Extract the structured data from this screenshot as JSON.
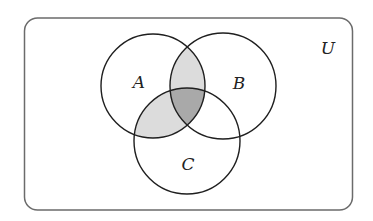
{
  "diagram": {
    "type": "venn",
    "universe": {
      "label": "U",
      "label_pos": [
        328,
        54
      ],
      "rect": {
        "x": 24.5,
        "y": 18,
        "w": 328,
        "h": 192,
        "rx": 13
      },
      "stroke": "#6b6b6b"
    },
    "sets": [
      {
        "name": "A",
        "label": "A",
        "cx": 153,
        "cy": 86,
        "r": 52,
        "label_pos": [
          139,
          88
        ]
      },
      {
        "name": "B",
        "label": "B",
        "cx": 223,
        "cy": 86,
        "r": 53,
        "label_pos": [
          239,
          89
        ]
      },
      {
        "name": "C",
        "label": "C",
        "cx": 187,
        "cy": 141,
        "r": 53,
        "label_pos": [
          188,
          170
        ]
      }
    ],
    "shaded_regions": [
      {
        "region": "A∩B only",
        "color": "#dcdcdc"
      },
      {
        "region": "A∩C only",
        "color": "#dcdcdc"
      },
      {
        "region": "A∩B∩C",
        "color": "#a9a9a9"
      }
    ],
    "circle_stroke": "#1f1f1f",
    "light_shade": "#dcdcdc",
    "dark_shade": "#a9a9a9"
  }
}
